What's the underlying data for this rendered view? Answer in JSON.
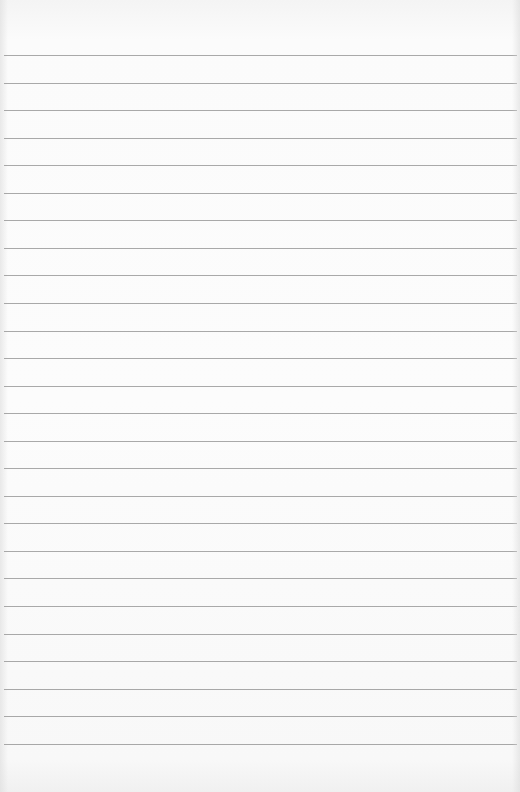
{
  "paper": {
    "type": "lined-paper",
    "background_color": "#fbfbfb",
    "rule_color": "#9a9a9a",
    "rule_count": 26,
    "first_rule_y": 55,
    "rule_spacing": 27.55,
    "text_content": []
  }
}
